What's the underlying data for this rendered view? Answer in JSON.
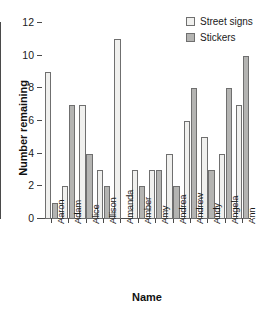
{
  "chart_data": {
    "type": "bar",
    "title": "",
    "xlabel": "Name",
    "ylabel": "Number remaining",
    "categories": [
      "Aaron",
      "Adam",
      "Alice",
      "Allison",
      "Amanda",
      "Amber",
      "Amy",
      "Andrea",
      "Andrew",
      "Andy",
      "Angela",
      "Ann"
    ],
    "series": [
      {
        "name": "Street signs",
        "color": "#f0f0ee",
        "values": [
          9,
          2,
          7,
          3,
          11,
          3,
          3,
          4,
          6,
          5,
          4,
          7
        ]
      },
      {
        "name": "Stickers",
        "color": "#b4b4b2",
        "values": [
          1,
          7,
          4,
          2,
          0,
          2,
          3,
          2,
          8,
          3,
          8,
          10
        ]
      }
    ],
    "ylim": [
      0,
      12
    ],
    "yticks": [
      0,
      2,
      4,
      6,
      8,
      10,
      12
    ],
    "ytick_labels": [
      "0",
      "2",
      "4",
      "6",
      "8",
      "10",
      "12"
    ],
    "grid": false,
    "legend_position": "top-right"
  },
  "legend": {
    "entries": [
      {
        "label": "Street signs"
      },
      {
        "label": "Stickers"
      }
    ]
  },
  "axes": {
    "y_title": "Number remaining",
    "x_title": "Name"
  }
}
